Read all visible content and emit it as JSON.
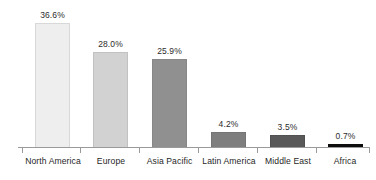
{
  "chart_data": {
    "type": "bar",
    "title": "",
    "subtitle": "",
    "xlabel": "",
    "ylabel": "",
    "grid": false,
    "legend": false,
    "ylim": [
      0,
      40
    ],
    "categories": [
      "North America",
      "Europe",
      "Asia Pacific",
      "Latin America",
      "Middle East",
      "Africa"
    ],
    "values": [
      36.6,
      28.0,
      25.9,
      4.2,
      3.5,
      0.7
    ],
    "value_labels": [
      "36.6%",
      "28.0%",
      "25.9%",
      "4.2%",
      "3.5%",
      "0.7%"
    ],
    "bar_colors": [
      "#eeeeee",
      "#d2d2d2",
      "#909090",
      "#7e7e7e",
      "#595959",
      "#0d0d0d"
    ],
    "axis_color": "#9a9a9a"
  },
  "bars": [
    {
      "label": "North America",
      "value_label": "36.6%",
      "value": 36.6,
      "color": "#eeeeee",
      "border": "#d8d8d8",
      "left": 35,
      "width": 35,
      "height": 125,
      "label_left": 9,
      "label_width": 88
    },
    {
      "label": "Europe",
      "value_label": "28.0%",
      "value": 28.0,
      "color": "#d2d2d2",
      "border": "#c2c2c2",
      "left": 93,
      "width": 35,
      "height": 96,
      "label_left": 73,
      "label_width": 76
    },
    {
      "label": "Asia Pacific",
      "value_label": "25.9%",
      "value": 25.9,
      "color": "#909090",
      "border": "#878787",
      "left": 152,
      "width": 35,
      "height": 89,
      "label_left": 129,
      "label_width": 81
    },
    {
      "label": "Latin America",
      "value_label": "4.2%",
      "value": 4.2,
      "color": "#7e7e7e",
      "border": "#757575",
      "left": 211,
      "width": 35,
      "height": 16,
      "label_left": 185,
      "label_width": 88
    },
    {
      "label": "Middle East",
      "value_label": "3.5%",
      "value": 3.5,
      "color": "#595959",
      "border": "#515151",
      "left": 270,
      "width": 35,
      "height": 13,
      "label_left": 248,
      "label_width": 80
    },
    {
      "label": "Africa",
      "value_label": "0.7%",
      "value": 0.7,
      "color": "#0d0d0d",
      "border": "#0d0d0d",
      "left": 328,
      "width": 35,
      "height": 4,
      "label_left": 313,
      "label_width": 64
    }
  ],
  "ticks": [
    22,
    80,
    139,
    198,
    257,
    316,
    369
  ]
}
